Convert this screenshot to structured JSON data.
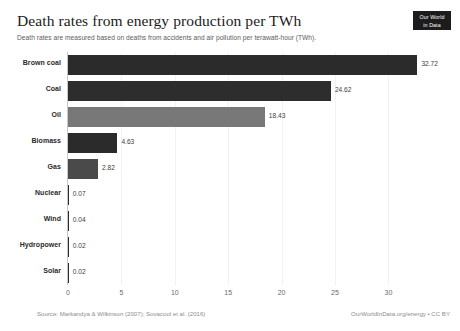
{
  "header": {
    "title": "Death rates from energy production per TWh",
    "subtitle": "Death rates are measured based on deaths from accidents and air pollution per terawatt-hour (TWh)."
  },
  "logo": {
    "line1": "Our World",
    "line2": "in Data"
  },
  "footer": {
    "source": "Source: Markandya & Wilkinson (2007); Sovacool et al. (2016)",
    "attribution": "OurWorldInData.org/energy • CC BY"
  },
  "colors": {
    "bar_dark": "#2b2b2b",
    "bar_mid": "#4a4a4a",
    "bar_gray": "#787878",
    "axis": "#c8c8c8",
    "grid": "#f2f2f2",
    "logo_bg": "#1c1c1c"
  },
  "chart_data": {
    "type": "bar",
    "orientation": "horizontal",
    "title": "Death rates from energy production per TWh",
    "subtitle": "Death rates are measured based on deaths from accidents and air pollution per terawatt-hour (TWh).",
    "xlabel": "",
    "ylabel": "",
    "xlim": [
      0,
      34
    ],
    "grid": true,
    "legend": null,
    "xticks": [
      "0",
      "5",
      "10",
      "15",
      "20",
      "25",
      "30"
    ],
    "xtick_values": [
      0,
      5,
      10,
      15,
      20,
      25,
      30
    ],
    "categories": [
      "Brown coal",
      "Coal",
      "Oil",
      "Biomass",
      "Gas",
      "Nuclear",
      "Wind",
      "Hydropower",
      "Solar"
    ],
    "values": [
      32.72,
      24.62,
      18.43,
      4.63,
      2.82,
      0.07,
      0.04,
      0.02,
      0.02
    ],
    "value_labels": [
      "32.72",
      "24.62",
      "18.43",
      "4.63",
      "2.82",
      "0.07",
      "0.04",
      "0.02",
      "0.02"
    ],
    "bar_colors": [
      "#2b2b2b",
      "#2d2d2d",
      "#787878",
      "#2b2b2b",
      "#4a4a4a",
      "#2b2b2b",
      "#2b2b2b",
      "#2b2b2b",
      "#2b2b2b"
    ]
  }
}
